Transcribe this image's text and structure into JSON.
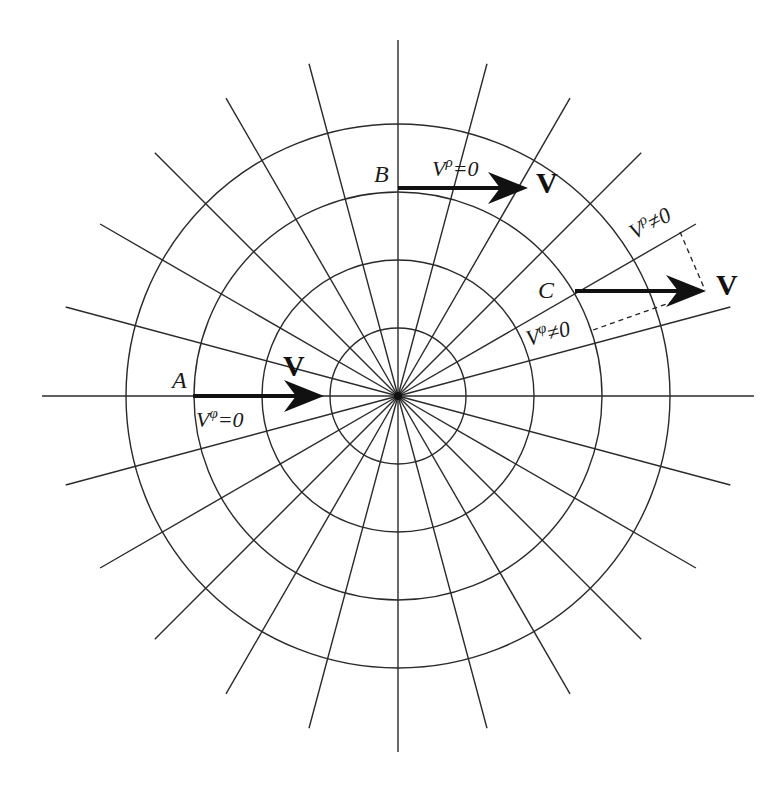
{
  "figure": {
    "center": {
      "x": 398,
      "y": 396
    },
    "circle_radii": [
      68,
      136,
      204,
      272
    ],
    "ray_angle_step_deg": 15,
    "ray_length_axis": 356,
    "ray_length_diagonal": 344,
    "colors": {
      "line": "#2a2a2a",
      "vector": "#111111",
      "background": "#ffffff"
    }
  },
  "points": {
    "A": {
      "label": "A",
      "vector_label": "V",
      "component_label_base": "V",
      "component_label_sup": "φ",
      "component_label_rest": "=0"
    },
    "B": {
      "label": "B",
      "vector_label": "V",
      "component_label_base": "V",
      "component_label_sup": "ρ",
      "component_label_rest": "=0"
    },
    "C": {
      "label": "C",
      "vector_label": "V",
      "radial_label_base": "V",
      "radial_label_sup": "ρ",
      "radial_label_rest": "≠0",
      "angular_label_base": "V",
      "angular_label_sup": "φ",
      "angular_label_rest": "≠0"
    }
  }
}
